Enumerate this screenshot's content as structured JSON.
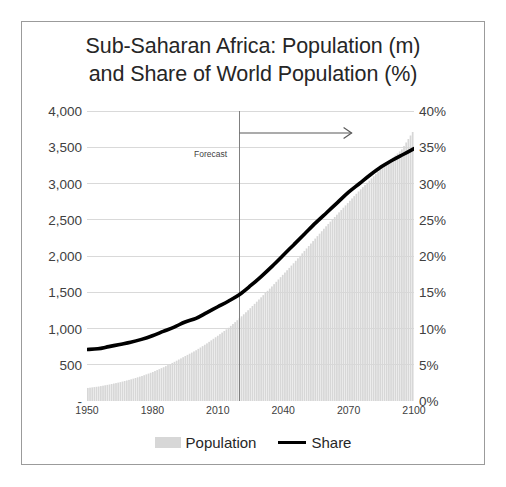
{
  "chart_data": {
    "type": "area",
    "title": "Sub-Saharan Africa: Population (m) and Share of World Population (%)",
    "title_line1": "Sub-Saharan Africa: Population (m)",
    "title_line2": "and Share of World Population (%)",
    "xlabel": "",
    "ylabel": "",
    "y_left_label": "Population (m)",
    "y_right_label": "Share of World Population (%)",
    "xlim": [
      1950,
      2100
    ],
    "ylim_left": [
      0,
      4000
    ],
    "ylim_right": [
      0,
      40
    ],
    "grid": true,
    "legend_position": "bottom",
    "x_ticks": [
      "1950",
      "1980",
      "2010",
      "2040",
      "2070",
      "2100"
    ],
    "x_tick_values": [
      1950,
      1980,
      2010,
      2040,
      2070,
      2100
    ],
    "y_left_ticks": [
      "4,000",
      "3,500",
      "3,000",
      "2,500",
      "2,000",
      "1,500",
      "1,000",
      "500",
      "-"
    ],
    "y_left_tick_values": [
      4000,
      3500,
      3000,
      2500,
      2000,
      1500,
      1000,
      500,
      0
    ],
    "y_right_ticks": [
      "40%",
      "35%",
      "30%",
      "25%",
      "20%",
      "15%",
      "10%",
      "5%",
      "0%"
    ],
    "y_right_tick_values": [
      40,
      35,
      30,
      25,
      20,
      15,
      10,
      5,
      0
    ],
    "annotations": [
      {
        "text": "Forecast",
        "x": 2020,
        "type": "forecast-divider-arrow"
      }
    ],
    "forecast_start_year": 2020,
    "legend": [
      {
        "name": "Population",
        "type": "area",
        "color": "#d7d7d7"
      },
      {
        "name": "Share",
        "type": "line",
        "color": "#000000"
      }
    ],
    "x": [
      1950,
      1955,
      1960,
      1965,
      1970,
      1975,
      1980,
      1985,
      1990,
      1995,
      2000,
      2005,
      2010,
      2015,
      2020,
      2025,
      2030,
      2035,
      2040,
      2045,
      2050,
      2055,
      2060,
      2065,
      2070,
      2075,
      2080,
      2085,
      2090,
      2095,
      2100
    ],
    "series": [
      {
        "name": "Population",
        "axis": "left",
        "unit": "millions",
        "type": "area",
        "color": "#d7d7d7",
        "values": [
          180,
          200,
          228,
          260,
          299,
          345,
          400,
          466,
          540,
          620,
          700,
          795,
          900,
          1010,
          1140,
          1280,
          1430,
          1580,
          1740,
          1900,
          2070,
          2240,
          2410,
          2570,
          2730,
          2890,
          3040,
          3190,
          3330,
          3470,
          3710
        ]
      },
      {
        "name": "Share",
        "axis": "right",
        "unit": "percent",
        "type": "line",
        "color": "#000000",
        "values": [
          7.1,
          7.2,
          7.5,
          7.8,
          8.1,
          8.5,
          9.0,
          9.6,
          10.2,
          10.9,
          11.4,
          12.2,
          13.0,
          13.8,
          14.7,
          15.9,
          17.2,
          18.6,
          20.1,
          21.6,
          23.1,
          24.6,
          26.0,
          27.4,
          28.8,
          30.0,
          31.2,
          32.3,
          33.2,
          34.0,
          34.8
        ]
      }
    ]
  },
  "title": {
    "line1": "Sub-Saharan Africa: Population (m)",
    "line2": "and Share of World Population (%)"
  },
  "annotation": {
    "forecast_label": "Forecast"
  },
  "legend": {
    "population_label": "Population",
    "share_label": "Share"
  },
  "colors": {
    "area_fill": "#d7d7d7",
    "line": "#000000",
    "grid": "#d9d9d9",
    "border": "#9b9b9b",
    "text": "#404040",
    "title_text": "#262626"
  }
}
